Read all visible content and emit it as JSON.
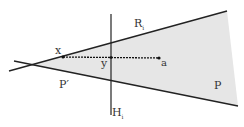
{
  "diagram": {
    "labels": {
      "x": "x",
      "y": "y",
      "a": "a",
      "R": "R",
      "R_sub": "i",
      "H": "H",
      "H_sub": "i",
      "P_prime": "P′",
      "P": "P"
    },
    "colors": {
      "line": "#222222",
      "shade": "#e6e6e6",
      "text": "#333333"
    }
  }
}
